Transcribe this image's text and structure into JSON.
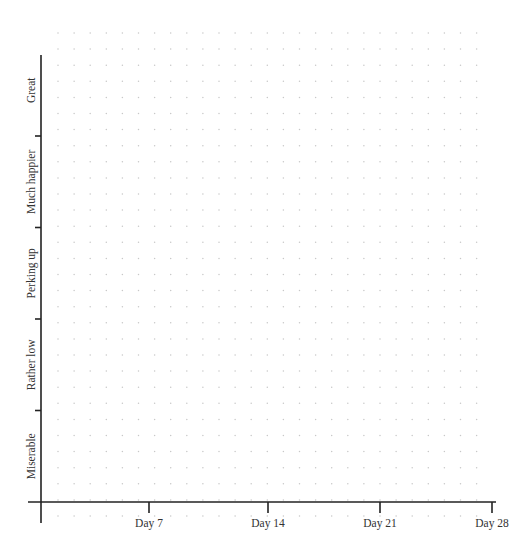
{
  "chart_data": {
    "type": "line",
    "title": "",
    "xlabel": "",
    "ylabel": "",
    "categories": [
      "Day 7",
      "Day 14",
      "Day 21",
      "Day 28"
    ],
    "x_ticks": [
      7,
      14,
      21,
      28
    ],
    "x_tick_labels": [
      "Day 7",
      "Day 14",
      "Day 21",
      "Day 28"
    ],
    "xlim": [
      0,
      28
    ],
    "y_categories": [
      "Miserable",
      "Rather low",
      "Perking up",
      "Much happier",
      "Great"
    ],
    "ylim": [
      0,
      5
    ],
    "series": [],
    "grid": "dotted",
    "legend": null
  },
  "axes": {
    "color": "#222222",
    "dot_color": "#c8c8c8"
  }
}
